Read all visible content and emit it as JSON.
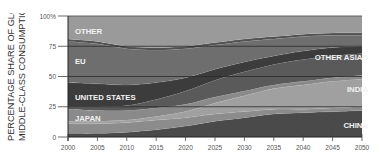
{
  "chart_data": {
    "type": "area",
    "stacked": true,
    "title": "",
    "xlabel": "",
    "ylabel_lines": [
      "PERCENTAGE SHARE OF GLOBAL",
      "MIDDLE-CLASS CONSUMPTION"
    ],
    "ylim": [
      0,
      100
    ],
    "xlim": [
      2000,
      2050
    ],
    "x": [
      2000,
      2005,
      2010,
      2015,
      2020,
      2025,
      2030,
      2035,
      2040,
      2045,
      2050
    ],
    "x_tick_labels": [
      "2000",
      "2005",
      "2010",
      "2015",
      "2020",
      "2025",
      "2030",
      "2035",
      "2040",
      "2045",
      "2050"
    ],
    "y_tick_labels": [
      "0",
      "25",
      "50",
      "75",
      "100%"
    ],
    "y_ticks": [
      0,
      25,
      50,
      75,
      100
    ],
    "grid": "horizontal lines at 25, 50, 75",
    "series": [
      {
        "name": "CHINA",
        "color": "#4a4a4a",
        "values": [
          3,
          3,
          4,
          6,
          9,
          13,
          16,
          19,
          20,
          21,
          22
        ]
      },
      {
        "name": "",
        "color": "#8c8c8c",
        "values": [
          8,
          8,
          8,
          8,
          7,
          6,
          5,
          4,
          3,
          3,
          3
        ]
      },
      {
        "name": "INDIA",
        "color": "#a0a0a0",
        "values": [
          2,
          2,
          2,
          3,
          5,
          9,
          13,
          17,
          20,
          22,
          23
        ]
      },
      {
        "name": "JAPAN",
        "color": "#8a8a8a",
        "values": [
          10,
          9,
          8,
          7,
          6,
          5,
          4,
          3,
          3,
          3,
          3
        ]
      },
      {
        "name": "OTHER ASIAN",
        "color": "#5a5a5a",
        "values": [
          2,
          3,
          4,
          7,
          11,
          14,
          16,
          17,
          18,
          18,
          18
        ]
      },
      {
        "name": "UNITED STATES",
        "color": "#3c3c3c",
        "values": [
          20,
          19,
          17,
          14,
          11,
          9,
          8,
          7,
          7,
          7,
          6
        ]
      },
      {
        "name": "EU",
        "color": "#6e6e6e",
        "values": [
          34,
          33,
          30,
          27,
          24,
          20,
          17,
          14,
          12,
          10,
          9
        ]
      },
      {
        "name": "",
        "color": "#525252",
        "values": [
          2,
          2,
          2,
          2,
          2,
          2,
          2,
          2,
          2,
          2,
          2
        ]
      },
      {
        "name": "OTHER",
        "color": "#9a9a9a",
        "values": [
          19,
          21,
          25,
          26,
          25,
          22,
          19,
          17,
          15,
          14,
          14
        ]
      }
    ],
    "annotations": [
      {
        "text": "OTHER",
        "x": 2001,
        "y": 88
      },
      {
        "text": "EU",
        "x": 2001,
        "y": 63
      },
      {
        "text": "UNITED STATES",
        "x": 2001,
        "y": 33
      },
      {
        "text": "JAPAN",
        "x": 2001,
        "y": 16
      },
      {
        "text": "OTHER ASIAN",
        "x": 2049,
        "y": 66
      },
      {
        "text": "INDIA",
        "x": 2049,
        "y": 40
      },
      {
        "text": "CHINA",
        "x": 2049,
        "y": 10
      }
    ]
  },
  "labels": {
    "other": "OTHER",
    "eu": "EU",
    "us": "UNITED STATES",
    "japan": "JAPAN",
    "other_asian": "OTHER ASIAN",
    "india": "INDIA",
    "china": "CHINA"
  }
}
